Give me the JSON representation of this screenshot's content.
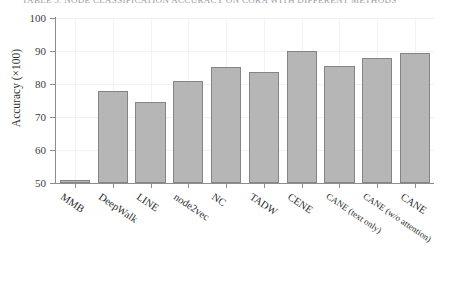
{
  "caption": {
    "partial_text": "TABLE 5. NODE CLASSIFICATION ACCURACY ON CORA WITH DIFFERENT METHODS"
  },
  "chart_data": {
    "type": "bar",
    "title": "",
    "xlabel": "",
    "ylabel": "Accuracy (×100)",
    "ylim": [
      50,
      100
    ],
    "yticks": [
      50,
      60,
      70,
      80,
      90,
      100
    ],
    "ytick_labels": [
      "50",
      "60",
      "70",
      "80",
      "90",
      "100"
    ],
    "grid": true,
    "legend": "none",
    "categories": [
      "MMB",
      "DeepWalk",
      "LINE",
      "node2vec",
      "NC",
      "TADW",
      "CENE",
      "CANE (text only)",
      "CANE (w/o attention)",
      "CANE"
    ],
    "values": [
      51.0,
      77.9,
      74.4,
      81.0,
      85.3,
      83.6,
      90.0,
      85.4,
      87.9,
      89.4
    ],
    "bar_color": "#b6b6b6",
    "bar_edge_color": "#848484"
  }
}
